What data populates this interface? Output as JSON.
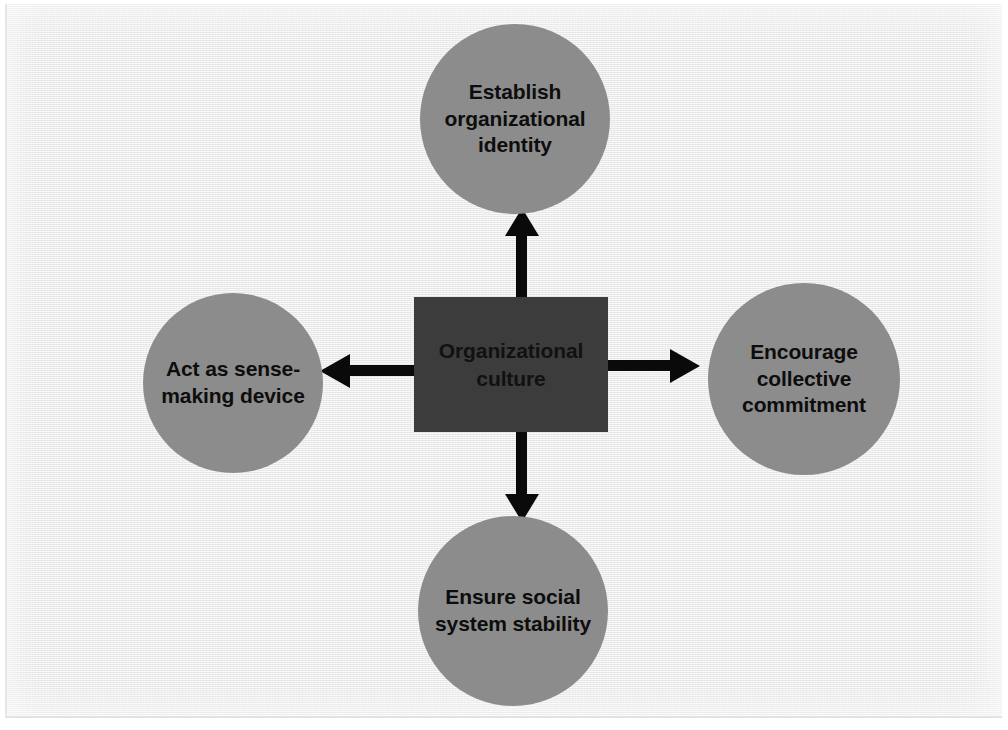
{
  "diagram": {
    "type": "hub-and-spoke",
    "center": {
      "label": "Organizational culture",
      "shape": "rectangle",
      "fill": "#3c3c3c"
    },
    "nodes": [
      {
        "id": "top",
        "label": "Establish organizational identity",
        "shape": "circle",
        "fill": "#8c8c8c",
        "direction": "up"
      },
      {
        "id": "right",
        "label": "Encourage collective commitment",
        "shape": "circle",
        "fill": "#8c8c8c",
        "direction": "right"
      },
      {
        "id": "bottom",
        "label": "Ensure social system stability",
        "shape": "circle",
        "fill": "#8c8c8c",
        "direction": "down"
      },
      {
        "id": "left",
        "label": "Act as sense-making device",
        "shape": "circle",
        "fill": "#8c8c8c",
        "direction": "left"
      }
    ],
    "arrows": [
      {
        "id": "arrow-up",
        "from": "center",
        "to": "top",
        "direction": "up",
        "color": "#0a0a0a"
      },
      {
        "id": "arrow-right",
        "from": "center",
        "to": "right",
        "direction": "right",
        "color": "#0a0a0a"
      },
      {
        "id": "arrow-down",
        "from": "center",
        "to": "bottom",
        "direction": "down",
        "color": "#0a0a0a"
      },
      {
        "id": "arrow-left",
        "from": "center",
        "to": "left",
        "direction": "left",
        "color": "#0a0a0a"
      }
    ],
    "colors": {
      "background": "#eeeeee",
      "node_fill": "#8c8c8c",
      "center_fill": "#3c3c3c",
      "arrow": "#0a0a0a",
      "text": "#0d0d0d"
    }
  }
}
